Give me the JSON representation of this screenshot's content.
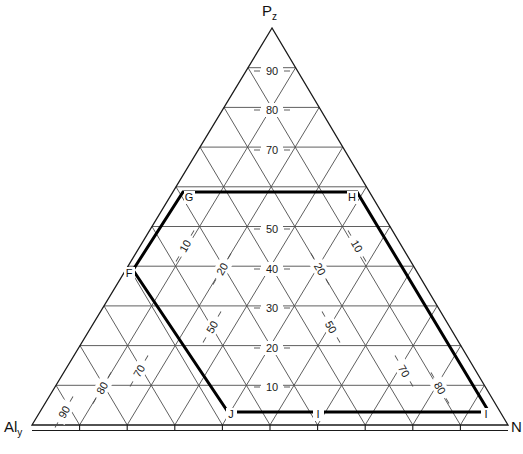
{
  "figure": {
    "type": "ternary-diagram",
    "width": 523,
    "height": 454,
    "background": "#ffffff",
    "grid_color": "#4d4d4d",
    "outline_color": "#1a1a1a",
    "highlight_color": "#000000"
  },
  "apexes": {
    "top": {
      "base": "P",
      "sub": "z",
      "full": "Pz"
    },
    "bottom_left": {
      "base": "Al",
      "sub": "y",
      "full": "Aly"
    },
    "bottom_right": {
      "base": "N",
      "sub": "",
      "full": "N"
    }
  },
  "axes": {
    "center_axis_name": "Pz",
    "left_axis_name": "Aly",
    "right_axis_name": "N",
    "tick_interval": 10,
    "range": [
      0,
      100
    ]
  },
  "chart_data": {
    "type": "ternary",
    "title": "",
    "xlabel": "Aly",
    "ylabel": "Pz",
    "zlabel": "N",
    "grid": true,
    "tick_interval": 10,
    "center_ticks": [
      "10",
      "20",
      "30",
      "40",
      "50",
      "70",
      "80",
      "90"
    ],
    "left_ticks": [
      "10",
      "20",
      "50",
      "70",
      "80",
      "90"
    ],
    "right_ticks": [
      "10",
      "20",
      "50",
      "70",
      "80"
    ],
    "region_label": "FGHIJ",
    "points": [
      {
        "label": "F",
        "x": 133,
        "y": 270
      },
      {
        "label": "G",
        "x": 183,
        "y": 192
      },
      {
        "label": "H",
        "x": 357,
        "y": 192
      },
      {
        "label": "I",
        "x": 489,
        "y": 412
      },
      {
        "label": "I",
        "x": 318,
        "y": 412
      },
      {
        "label": "J",
        "x": 228,
        "y": 412
      }
    ]
  },
  "vertex_labels": [
    {
      "name": "G",
      "text": "G",
      "x": 189,
      "y": 201
    },
    {
      "name": "H",
      "text": "H",
      "x": 352,
      "y": 201
    },
    {
      "name": "F",
      "text": "F",
      "x": 129,
      "y": 277
    },
    {
      "name": "J",
      "text": "J",
      "x": 231,
      "y": 418
    },
    {
      "name": "I-mid",
      "text": "I",
      "x": 318,
      "y": 418
    },
    {
      "name": "I-right",
      "text": "I",
      "x": 486,
      "y": 418
    }
  ],
  "center_tick_labels": [
    {
      "value": "90",
      "x": 272,
      "y": 71
    },
    {
      "value": "80",
      "x": 272,
      "y": 110
    },
    {
      "value": "70",
      "x": 272,
      "y": 150
    },
    {
      "value": "50",
      "x": 272,
      "y": 229
    },
    {
      "value": "40",
      "x": 272,
      "y": 269
    },
    {
      "value": "30",
      "x": 272,
      "y": 308
    },
    {
      "value": "20",
      "x": 272,
      "y": 348
    },
    {
      "value": "10",
      "x": 272,
      "y": 387
    }
  ],
  "left_tick_labels": [
    {
      "value": "10",
      "x": 185,
      "y": 246,
      "rotate": -60
    },
    {
      "value": "20",
      "x": 222,
      "y": 269,
      "rotate": -60
    },
    {
      "value": "50",
      "x": 212,
      "y": 327,
      "rotate": -60
    },
    {
      "value": "70",
      "x": 139,
      "y": 371,
      "rotate": -60
    },
    {
      "value": "80",
      "x": 102,
      "y": 388,
      "rotate": -60
    },
    {
      "value": "90",
      "x": 64,
      "y": 412,
      "rotate": -60
    }
  ],
  "right_tick_labels": [
    {
      "value": "10",
      "x": 357,
      "y": 246,
      "rotate": 60
    },
    {
      "value": "20",
      "x": 320,
      "y": 269,
      "rotate": 60
    },
    {
      "value": "50",
      "x": 331,
      "y": 327,
      "rotate": 60
    },
    {
      "value": "70",
      "x": 404,
      "y": 371,
      "rotate": 60
    },
    {
      "value": "80",
      "x": 440,
      "y": 388,
      "rotate": 60
    }
  ]
}
